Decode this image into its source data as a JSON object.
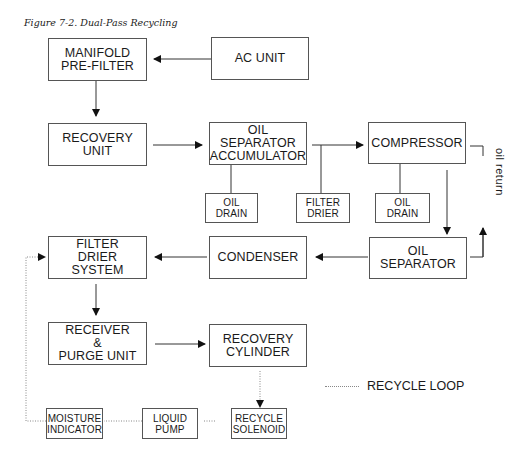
{
  "caption": "Figure 7-2. Dual-Pass Recycling",
  "boxes": {
    "manifold": "MANIFOLD\nPRE-FILTER",
    "ac_unit": "AC  UNIT",
    "recovery_unit": "RECOVERY\nUNIT",
    "oil_sep_acc": "OIL\nSEPARATOR\nACCUMULATOR",
    "compressor": "COMPRESSOR",
    "oil_drain_1": "OIL\nDRAIN",
    "filter_drier": "FILTER\nDRIER",
    "oil_drain_2": "OIL\nDRAIN",
    "filter_drier_system": "FILTER\nDRIER\nSYSTEM",
    "condenser": "CONDENSER",
    "oil_separator": "OIL\nSEPARATOR",
    "receiver": "RECEIVER\n&\nPURGE  UNIT",
    "recovery_cylinder": "RECOVERY\nCYLINDER",
    "moisture_indicator": "MOISTURE\nINDICATOR",
    "liquid_pump": "LIQUID\nPUMP",
    "recycle_solenoid": "RECYCLE\nSOLENOID"
  },
  "labels": {
    "oil_return": "oil  return",
    "legend": "RECYCLE  LOOP"
  }
}
